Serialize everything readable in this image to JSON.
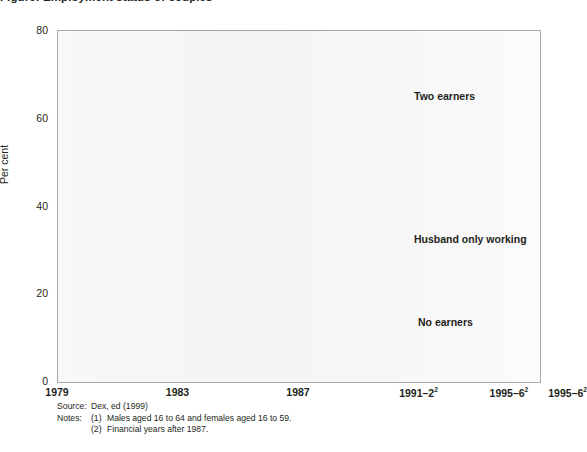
{
  "title": "Figure: Employment status of couples",
  "axes": {
    "y_title": "Per cent",
    "y_ticks": [
      "0",
      "20",
      "40",
      "60",
      "80"
    ],
    "y_tick_values": [
      0,
      20,
      40,
      60,
      80
    ],
    "x_ticks": [
      {
        "label": "1979",
        "sup": ""
      },
      {
        "label": "1983",
        "sup": ""
      },
      {
        "label": "1987",
        "sup": ""
      },
      {
        "label": "1991–2",
        "sup": "2"
      },
      {
        "label": "1995–6",
        "sup": "2"
      },
      {
        "label": "1995–6",
        "sup": "2"
      }
    ]
  },
  "annotations": {
    "two_earners": "Two earners",
    "husband_only": "Husband only working",
    "no_earners": "No earners"
  },
  "footer": {
    "source_label": "Source:",
    "source_text": "Dex, ed (1999)",
    "notes_label": "Notes:",
    "note1_num": "(1)",
    "note1_text": "Males aged 16 to 64 and females aged 16 to 59.",
    "note2_num": "(2)",
    "note2_text": "Financial years after 1987."
  },
  "colors": {
    "two_earners": "#5a5a5a",
    "husband_only": "#1a1a1a",
    "no_earners": "#a0a0a0",
    "plot_bg": "#f7f7f7",
    "frame": "#a8a8a8",
    "grid": "#e2e2e2",
    "text": "#231f20"
  },
  "chart_data": {
    "type": "line",
    "title": "Employment status of couples",
    "xlabel": "",
    "ylabel": "Per cent",
    "ylim": [
      0,
      80
    ],
    "xlim": [
      1979,
      1996
    ],
    "grid": true,
    "legend": "inline-annotations",
    "x": [
      1979,
      1980,
      1981,
      1982,
      1983,
      1984,
      1985,
      1986,
      1987,
      1988,
      1989,
      1990,
      1991,
      1992,
      1993,
      1994,
      1995
    ],
    "x_tick_labels": [
      "1979",
      "1983",
      "1987",
      "1991–2",
      "1995–6",
      "1995–6"
    ],
    "series": [
      {
        "name": "Two earners",
        "color": "#5a5a5a",
        "values": [
          51.0,
          51.0,
          48.5,
          47.5,
          47.5,
          45.0,
          48.0,
          50.5,
          52.5,
          53.0,
          56.5,
          60.0,
          60.0,
          60.0,
          59.5,
          60.5,
          62.5
        ]
      },
      {
        "name": "Husband only working",
        "color": "#1a1a1a",
        "values": [
          42.5,
          41.0,
          39.5,
          39.5,
          38.5,
          39.5,
          38.0,
          36.5,
          36.0,
          35.0,
          33.5,
          32.5,
          31.5,
          30.5,
          29.0,
          26.5,
          26.0
        ]
      },
      {
        "name": "No earners",
        "color": "#a0a0a0",
        "values": [
          5.0,
          6.5,
          8.0,
          9.5,
          10.5,
          10.5,
          10.5,
          10.5,
          10.5,
          7.0,
          6.5,
          6.5,
          6.5,
          9.0,
          8.5,
          11.5,
          10.0
        ]
      }
    ]
  }
}
